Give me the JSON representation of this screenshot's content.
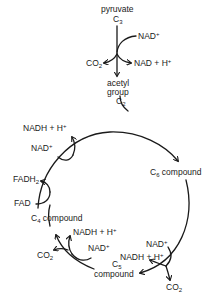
{
  "diagram": {
    "type": "metabolic-cycle",
    "entry": {
      "substrate": {
        "name": "pyruvate",
        "carbon": "C",
        "carbon_sub": "3"
      },
      "input": {
        "text": "NAD",
        "sup": "+"
      },
      "products": [
        {
          "text": "CO",
          "sub": "2"
        },
        {
          "text": "NAD + H",
          "sup": "+"
        }
      ],
      "output": {
        "line1": "acetyl",
        "line2": "group",
        "carbon": "C",
        "carbon_sub": "2"
      }
    },
    "cycle": {
      "nodes": [
        {
          "id": "c6",
          "carbon": "C",
          "carbon_sub": "6",
          "label": " compound"
        },
        {
          "id": "c5",
          "carbon": "C",
          "carbon_sub": "5",
          "label": "compound"
        },
        {
          "id": "c4",
          "carbon": "C",
          "carbon_sub": "4",
          "label": " compound"
        }
      ],
      "c6_to_c5": {
        "input": {
          "text": "NAD",
          "sup": "+"
        },
        "outputs": [
          {
            "text": "NADH + H",
            "sup": "+"
          },
          {
            "text": "CO",
            "sub": "2"
          }
        ]
      },
      "c5_to_c4": {
        "input": {
          "text": "NAD",
          "sup": "+"
        },
        "outputs": [
          {
            "text": "NADH + H",
            "sup": "+"
          },
          {
            "text": "CO",
            "sub": "2"
          }
        ]
      },
      "c4_fad": {
        "input": {
          "text": "FAD"
        },
        "output": {
          "text": "FADH",
          "sub": "2"
        }
      },
      "c4_nad": {
        "input": {
          "text": "NAD",
          "sup": "+"
        },
        "output": {
          "text": "NADH + H",
          "sup": "+"
        }
      }
    }
  }
}
